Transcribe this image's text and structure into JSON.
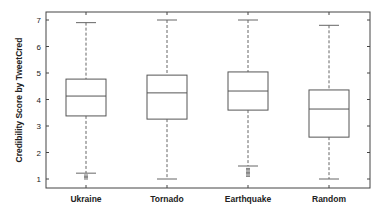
{
  "chart_data": {
    "type": "box",
    "title": "",
    "xlabel": "",
    "ylabel": "Credibility Score by TweetCred",
    "ylim": [
      0.65,
      7.3
    ],
    "yticks": [
      1,
      2,
      3,
      4,
      5,
      6,
      7
    ],
    "grid": false,
    "legend": null,
    "categories": [
      "Ukraine",
      "Tornado",
      "Earthquake",
      "Random"
    ],
    "series": [
      {
        "name": "Ukraine",
        "whisker_low": 1.22,
        "q1": 3.38,
        "median": 4.13,
        "q3": 4.77,
        "whisker_high": 6.9,
        "outliers": [
          1.15,
          1.1,
          1.05,
          1.0
        ]
      },
      {
        "name": "Tornado",
        "whisker_low": 1.0,
        "q1": 3.26,
        "median": 4.25,
        "q3": 4.92,
        "whisker_high": 7.0,
        "outliers": []
      },
      {
        "name": "Earthquake",
        "whisker_low": 1.49,
        "q1": 3.6,
        "median": 4.32,
        "q3": 5.04,
        "whisker_high": 7.0,
        "outliers": [
          1.4,
          1.35,
          1.3,
          1.25,
          1.2,
          1.15,
          1.1
        ]
      },
      {
        "name": "Random",
        "whisker_low": 1.0,
        "q1": 2.58,
        "median": 3.64,
        "q3": 4.36,
        "whisker_high": 6.8,
        "outliers": []
      }
    ]
  },
  "style": {
    "box_color": "#555555",
    "median_color": "#555555",
    "whisker_color": "#666666",
    "axis_color": "#444444"
  }
}
